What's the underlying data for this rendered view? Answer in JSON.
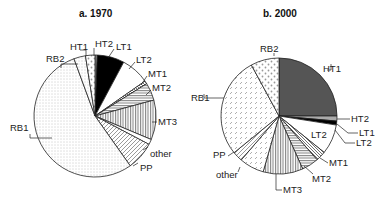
{
  "chart_data": [
    {
      "type": "pie",
      "title": "a. 1970",
      "categories": [
        "HT2",
        "LT1",
        "LT2",
        "MT1",
        "MT2",
        "MT3",
        "other",
        "PP",
        "RB1",
        "RB2",
        "HT1"
      ],
      "values": [
        0.6,
        7.2,
        7.5,
        0.8,
        4.7,
        10.5,
        1.4,
        7.5,
        54.2,
        3.1,
        2.5
      ],
      "unit": "percent (estimated from slice angles)"
    },
    {
      "type": "pie",
      "title": "b. 2000",
      "categories": [
        "HT1",
        "HT2",
        "LT1",
        "LT2",
        "MT1",
        "MT2",
        "MT3",
        "other",
        "PP",
        "RB1",
        "RB2"
      ],
      "values": [
        25.0,
        1.4,
        1.1,
        8.3,
        2.8,
        4.7,
        11.1,
        6.9,
        2.8,
        28.0,
        7.9
      ],
      "unit": "percent (estimated from slice angles)"
    }
  ],
  "titles": {
    "a": "a. 1970",
    "b": "b. 2000"
  },
  "labels_a": {
    "HT2": "HT2",
    "LT1": "LT1",
    "LT2": "LT2",
    "MT1": "MT1",
    "MT2": "MT2",
    "MT3": "MT3",
    "other": "other",
    "PP": "PP",
    "RB1": "RB1",
    "RB2": "RB2",
    "HT1": "HT1"
  },
  "labels_b": {
    "HT1": "HT1",
    "HT2": "HT2",
    "LT1": "LT1",
    "LT2": "LT2",
    "LT2_inner": "LT2",
    "MT1": "MT1",
    "MT2": "MT2",
    "MT3": "MT3",
    "other": "other",
    "PP": "PP",
    "RB1": "RB1",
    "RB2": "RB2"
  }
}
